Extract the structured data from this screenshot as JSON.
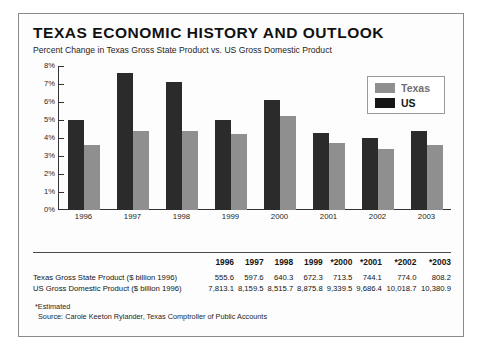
{
  "figure": {
    "title": "TEXAS ECONOMIC HISTORY AND OUTLOOK",
    "subtitle": "Percent Change in Texas Gross State Product vs. US Gross Domestic Product"
  },
  "legend": {
    "texas_label": "Texas",
    "us_label": "US",
    "texas_color": "#8f8f8f",
    "us_color": "#161616"
  },
  "footnotes": {
    "estimated": "*Estimated",
    "source": "Source: Carole Keeton Rylander, Texas Comptroller of Public Accounts"
  },
  "table": {
    "columns": [
      "",
      "1996",
      "1997",
      "1998",
      "1999",
      "*2000",
      "*2001",
      "*2002",
      "*2003"
    ],
    "rows": [
      {
        "label": "Texas Gross State Product ($ billion 1996)",
        "values": [
          "555.6",
          "597.6",
          "640.3",
          "672.3",
          "713.5",
          "744.1",
          "774.0",
          "808.2"
        ]
      },
      {
        "label": "US Gross Domestic Product ($ billion 1996)",
        "values": [
          "7,813.1",
          "8,159.5",
          "8,515.7",
          "8,875.8",
          "9,339.5",
          "9,686.4",
          "10,018.7",
          "10,380.9"
        ]
      }
    ]
  },
  "chart_data": {
    "type": "bar",
    "title": "TEXAS ECONOMIC HISTORY AND OUTLOOK",
    "subtitle": "Percent Change in Texas Gross State Product vs. US Gross Domestic Product",
    "xlabel": "",
    "ylabel": "",
    "ylim": [
      0,
      8
    ],
    "ytick_labels": [
      "8%",
      "7%",
      "6%",
      "5%",
      "4%",
      "3%",
      "2%",
      "1%",
      "0%"
    ],
    "ytick_values": [
      8,
      7,
      6,
      5,
      4,
      3,
      2,
      1,
      0
    ],
    "grid": false,
    "legend_position": "top-right",
    "categories": [
      "1996",
      "1997",
      "1998",
      "1999",
      "2000",
      "2001",
      "2002",
      "2003"
    ],
    "series": [
      {
        "name": "Texas",
        "color": "#2b2b2b",
        "values": [
          5.0,
          7.6,
          7.1,
          5.0,
          6.1,
          4.3,
          4.0,
          4.4
        ]
      },
      {
        "name": "US",
        "color": "#8f8f8f",
        "values": [
          3.6,
          4.4,
          4.4,
          4.2,
          5.2,
          3.7,
          3.4,
          3.6
        ]
      }
    ]
  }
}
